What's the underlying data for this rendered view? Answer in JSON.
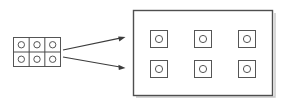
{
  "figure": {
    "title": "",
    "background_color": "#ffffff",
    "width": 284,
    "height": 103,
    "stroke_color": "#555555",
    "container_stroke_color": "#4f4f4f",
    "arrow_color": "#3c3c3c",
    "shadow_color": "#c8c8c8"
  },
  "source_group": {
    "label": "",
    "description": "contiguous 3-by-2 grid of cells, each containing a circle",
    "columns": 3,
    "rows": 2,
    "cell_count": 6,
    "x": 13,
    "y": 37,
    "width": 47,
    "height": 29,
    "cell_width": 15.667,
    "cell_height": 14.5,
    "circle_radius": 3.2,
    "cells": [
      {
        "label": "",
        "row": 0,
        "col": 0,
        "glyph": "circle"
      },
      {
        "label": "",
        "row": 0,
        "col": 1,
        "glyph": "circle"
      },
      {
        "label": "",
        "row": 0,
        "col": 2,
        "glyph": "circle"
      },
      {
        "label": "",
        "row": 1,
        "col": 0,
        "glyph": "circle"
      },
      {
        "label": "",
        "row": 1,
        "col": 1,
        "glyph": "circle"
      },
      {
        "label": "",
        "row": 1,
        "col": 2,
        "glyph": "circle"
      }
    ]
  },
  "arrows": [
    {
      "label": "",
      "name": "upper-arrow",
      "x1": 63,
      "y1": 50,
      "x2": 125,
      "y2": 37,
      "direction": "right-up"
    },
    {
      "label": "",
      "name": "lower-arrow",
      "x1": 63,
      "y1": 57,
      "x2": 125,
      "y2": 68,
      "direction": "right-down"
    }
  ],
  "target_group": {
    "label": "",
    "description": "large rectangle containing six separated squares, each with a circle",
    "columns": 3,
    "rows": 2,
    "item_count": 6,
    "x": 133,
    "y": 10,
    "width": 139,
    "height": 85,
    "item_size": 17,
    "item_circle_radius": 3.6,
    "items": [
      {
        "label": "",
        "row": 0,
        "col": 0,
        "x": 150,
        "y": 30,
        "glyph": "circle"
      },
      {
        "label": "",
        "row": 0,
        "col": 1,
        "x": 194,
        "y": 30,
        "glyph": "circle"
      },
      {
        "label": "",
        "row": 0,
        "col": 2,
        "x": 238,
        "y": 30,
        "glyph": "circle"
      },
      {
        "label": "",
        "row": 1,
        "col": 0,
        "x": 150,
        "y": 60,
        "glyph": "circle"
      },
      {
        "label": "",
        "row": 1,
        "col": 1,
        "x": 194,
        "y": 60,
        "glyph": "circle"
      },
      {
        "label": "",
        "row": 1,
        "col": 2,
        "x": 238,
        "y": 60,
        "glyph": "circle"
      }
    ]
  }
}
